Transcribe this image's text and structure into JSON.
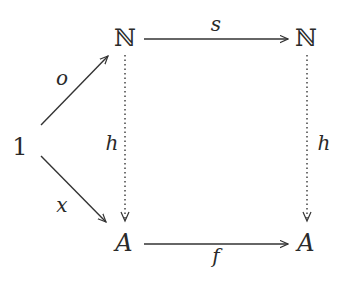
{
  "diagram": {
    "type": "commutative-diagram",
    "objects": {
      "one": {
        "label": "1",
        "x": 20,
        "y": 147
      },
      "n_left": {
        "label": "ℕ",
        "x": 125,
        "y": 38
      },
      "n_right": {
        "label": "ℕ",
        "x": 306,
        "y": 38
      },
      "a_left": {
        "label": "A",
        "x": 124,
        "y": 243
      },
      "a_right": {
        "label": "A",
        "x": 306,
        "y": 243
      }
    },
    "morphisms": {
      "o": {
        "label": "o",
        "from": "1",
        "to": "ℕ",
        "style": "solid",
        "label_x": 62,
        "label_y": 78
      },
      "x": {
        "label": "x",
        "from": "1",
        "to": "A",
        "style": "solid",
        "label_x": 62,
        "label_y": 205
      },
      "s": {
        "label": "s",
        "from": "ℕ",
        "to": "ℕ",
        "style": "solid",
        "label_x": 216,
        "label_y": 24
      },
      "f": {
        "label": "f",
        "from": "A",
        "to": "A",
        "style": "solid",
        "label_x": 216,
        "label_y": 256
      },
      "h_left": {
        "label": "h",
        "from": "ℕ",
        "to": "A",
        "style": "dotted",
        "label_x": 112,
        "label_y": 143
      },
      "h_right": {
        "label": "h",
        "from": "ℕ",
        "to": "A",
        "style": "dotted",
        "label_x": 324,
        "label_y": 143
      }
    },
    "colors": {
      "stroke": "#333333",
      "text": "#2a2a2a"
    }
  }
}
